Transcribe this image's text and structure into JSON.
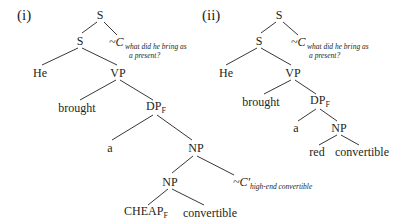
{
  "diagram": {
    "type": "syntax-tree-pair",
    "trees": [
      {
        "label": "(i)",
        "nodes": {
          "root": "S",
          "s_child": "S",
          "alt_set": {
            "symbol": "~C",
            "subscript_line1": "what did he bring as",
            "subscript_line2": "a present?"
          },
          "he": "He",
          "vp": "VP",
          "brought": "brought",
          "dp": {
            "text": "DP",
            "sub": "F"
          },
          "a": "a",
          "np_upper": "NP",
          "np_lower": "NP",
          "alt_set2": {
            "symbol": "~C′",
            "subscript": "high-end convertible"
          },
          "cheap": {
            "text": "CHEAP",
            "sub": "F"
          },
          "convertible": "convertible"
        }
      },
      {
        "label": "(ii)",
        "nodes": {
          "root": "S",
          "s_child": "S",
          "alt_set": {
            "symbol": "~C",
            "subscript_line1": "what did he bring as",
            "subscript_line2": "a present?"
          },
          "he": "He",
          "vp": "VP",
          "brought": "brought",
          "dp": {
            "text": "DP",
            "sub": "F"
          },
          "a": "a",
          "np": "NP",
          "red": "red",
          "convertible": "convertible"
        }
      }
    ]
  }
}
